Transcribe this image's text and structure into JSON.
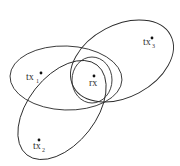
{
  "diagram": {
    "nodes": [
      {
        "id": "tx1",
        "label": "tx",
        "subscript": "1",
        "x": 39,
        "y": 75
      },
      {
        "id": "tx2",
        "label": "tx",
        "subscript": "2",
        "x": 38,
        "y": 141
      },
      {
        "id": "tx3",
        "label": "tx",
        "subscript": "3",
        "x": 152,
        "y": 39
      },
      {
        "id": "rx",
        "label": "rx",
        "subscript": "",
        "x": 94,
        "y": 77
      }
    ],
    "regions": [
      {
        "id": "ellipse-tx1",
        "cx": 66,
        "cy": 78,
        "rx": 56,
        "ry": 32,
        "rotate": 2
      },
      {
        "id": "ellipse-tx3",
        "cx": 122,
        "cy": 61,
        "rx": 55,
        "ry": 36,
        "rotate": -28
      },
      {
        "id": "ellipse-rx",
        "cx": 92,
        "cy": 80,
        "rx": 20,
        "ry": 23,
        "rotate": 0
      },
      {
        "id": "ellipse-tx2",
        "cx": 62,
        "cy": 110,
        "rx": 57,
        "ry": 34,
        "rotate": -52
      }
    ],
    "colors": {
      "stroke": "#2a2a2a",
      "text": "#333333",
      "background": "#ffffff"
    }
  }
}
